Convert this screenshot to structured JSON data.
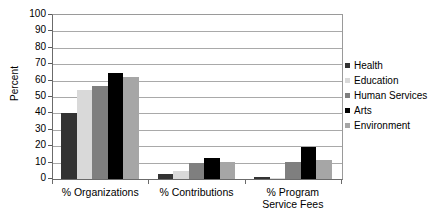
{
  "chart_data": {
    "type": "bar",
    "title": "",
    "xlabel": "",
    "ylabel": "Percent",
    "ylim": [
      0,
      100
    ],
    "yticks": [
      0,
      10,
      20,
      30,
      40,
      50,
      60,
      70,
      80,
      90,
      100
    ],
    "ytick_labels": [
      "0",
      "10",
      "20",
      "30",
      "40",
      "50",
      "60",
      "70",
      "80",
      "90",
      "100"
    ],
    "grid": true,
    "legend_position": "right",
    "categories": [
      "% Organizations",
      "% Contributions",
      "% Program Service Fees"
    ],
    "category_label_lines": [
      [
        "% Organizations"
      ],
      [
        "% Contributions"
      ],
      [
        "% Program",
        "Service Fees"
      ]
    ],
    "series": [
      {
        "name": "Health",
        "color": "#333333",
        "values": [
          40.5,
          3.0,
          1.0
        ]
      },
      {
        "name": "Education",
        "color": "#d9d9d9",
        "values": [
          54.5,
          5.0,
          0.6
        ]
      },
      {
        "name": "Human Services",
        "color": "#7f7f7f",
        "values": [
          56.5,
          10.0,
          10.3
        ]
      },
      {
        "name": "Arts",
        "color": "#000000",
        "values": [
          64.5,
          12.8,
          19.3
        ]
      },
      {
        "name": "Environment",
        "color": "#a6a6a6",
        "values": [
          62.0,
          10.3,
          11.5
        ]
      }
    ]
  }
}
